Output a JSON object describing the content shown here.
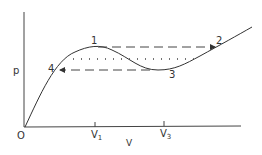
{
  "diagram": {
    "type": "p-v isotherm (van der Waals loop)",
    "axes": {
      "y_label": "p",
      "x_label": "V",
      "origin_label": "O"
    },
    "x_ticks": [
      {
        "label": "V",
        "sub": "1"
      },
      {
        "label": "V",
        "sub": "3"
      }
    ],
    "points": [
      {
        "label": "1",
        "desc": "local maximum"
      },
      {
        "label": "2",
        "desc": "right end of upper dashed line"
      },
      {
        "label": "3",
        "desc": "local minimum"
      },
      {
        "label": "4",
        "desc": "left end of lower dashed line"
      }
    ],
    "lines": {
      "dashed_upper": "1 -> 2",
      "dashed_lower": "3 -> 4",
      "dotted_middle": "equal-area horizontal"
    },
    "colors": {
      "ink": "#333333",
      "background": "#ffffff"
    }
  }
}
